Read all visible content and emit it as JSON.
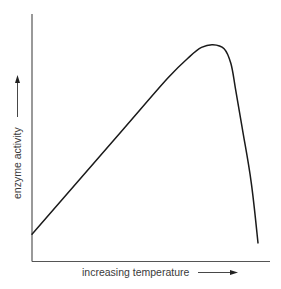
{
  "chart_data": {
    "type": "line",
    "title": "",
    "xlabel": "increasing temperature",
    "ylabel": "enzyme activity",
    "x_ticks": [],
    "y_ticks": [],
    "grid": false,
    "legend": null,
    "xlim": [
      0,
      100
    ],
    "ylim": [
      0,
      100
    ],
    "series": [
      {
        "name": "enzyme activity",
        "x": [
          0,
          20,
          40,
          60,
          70,
          75,
          80,
          85,
          88,
          90,
          93,
          97,
          100
        ],
        "y": [
          11,
          32,
          53,
          74,
          83,
          86.5,
          87.6,
          86,
          80,
          70,
          54,
          32,
          7.5
        ]
      }
    ],
    "colors": {
      "curve": "#1a1a1a",
      "axes": "#555555",
      "text": "#3a3a3a"
    }
  }
}
